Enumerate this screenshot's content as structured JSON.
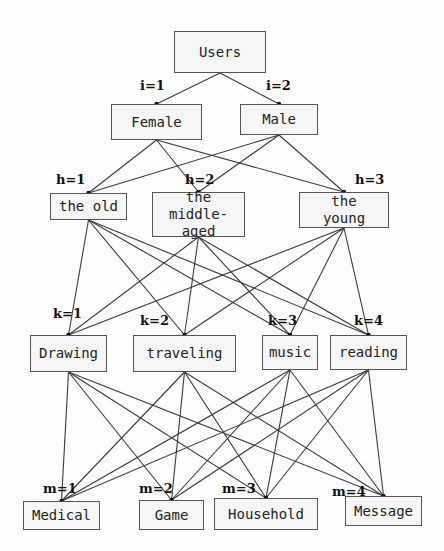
{
  "root": {
    "label": "Users",
    "x": 174,
    "y": 31,
    "w": 92,
    "h": 42
  },
  "layers": [
    {
      "name": "gender",
      "index_var": "i",
      "nodes": [
        {
          "label": "Female",
          "index": "i=1",
          "x": 111,
          "y": 104,
          "w": 91,
          "h": 36,
          "lx": 140,
          "ly": 78
        },
        {
          "label": "Male",
          "index": "i=2",
          "x": 240,
          "y": 104,
          "w": 78,
          "h": 31,
          "lx": 266,
          "ly": 78
        }
      ]
    },
    {
      "name": "age",
      "index_var": "h",
      "nodes": [
        {
          "label": "the old",
          "index": "h=1",
          "x": 50,
          "y": 193,
          "w": 77,
          "h": 27,
          "lx": 56,
          "ly": 172
        },
        {
          "label": "the middle-\naged",
          "index": "h=2",
          "x": 152,
          "y": 192,
          "w": 93,
          "h": 45,
          "lx": 185,
          "ly": 172
        },
        {
          "label": "the\nyoung",
          "index": "h=3",
          "x": 299,
          "y": 192,
          "w": 90,
          "h": 36,
          "lx": 355,
          "ly": 172
        }
      ]
    },
    {
      "name": "interest",
      "index_var": "k",
      "nodes": [
        {
          "label": "Drawing",
          "index": "k=1",
          "x": 30,
          "y": 335,
          "w": 77,
          "h": 37,
          "lx": 53,
          "ly": 306
        },
        {
          "label": "traveling",
          "index": "k=2",
          "x": 133,
          "y": 335,
          "w": 103,
          "h": 37,
          "lx": 140,
          "ly": 313
        },
        {
          "label": "music",
          "index": "k=3",
          "x": 262,
          "y": 335,
          "w": 56,
          "h": 35,
          "lx": 268,
          "ly": 313
        },
        {
          "label": "reading",
          "index": "k=4",
          "x": 330,
          "y": 335,
          "w": 77,
          "h": 35,
          "lx": 354,
          "ly": 313
        }
      ]
    },
    {
      "name": "app_category",
      "index_var": "m",
      "nodes": [
        {
          "label": "Medical",
          "index": "m=1",
          "x": 23,
          "y": 501,
          "w": 77,
          "h": 29,
          "lx": 43,
          "ly": 481
        },
        {
          "label": "Game",
          "index": "m=2",
          "x": 139,
          "y": 500,
          "w": 65,
          "h": 30,
          "lx": 139,
          "ly": 481
        },
        {
          "label": "Household",
          "index": "m=3",
          "x": 214,
          "y": 498,
          "w": 104,
          "h": 32,
          "lx": 222,
          "ly": 481
        },
        {
          "label": "Message",
          "index": "m=4",
          "x": 345,
          "y": 496,
          "w": 77,
          "h": 30,
          "lx": 332,
          "ly": 484
        }
      ]
    }
  ],
  "style": {
    "edge_color": "#3a3a3a",
    "border_color": "#555555",
    "node_fill": "#f6f6f6"
  }
}
